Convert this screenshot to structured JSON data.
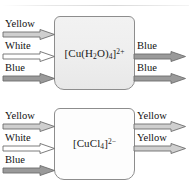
{
  "diagram": {
    "colors": {
      "yellow_beam": "#cfcfcf",
      "white_beam": "#ffffff",
      "blue_beam": "#9a9a9a",
      "outline": "#6e6e6e",
      "vessel_border": "#8d8d8d",
      "vessel_1_fill": "#eeeeee",
      "vessel_2_fill": "#fdfdfd",
      "text": "#111111"
    },
    "vessels": [
      {
        "id": "vessel-aqua-copper",
        "formula_text": "[Cu(H2O)4]2+",
        "formula_parts": {
          "open": "[Cu(H",
          "sub_1": "2",
          "mid": "O)",
          "sub_2": "4",
          "close": "]",
          "charge": "2+"
        },
        "inputs": [
          {
            "label": "Yellow",
            "beam": "yellow"
          },
          {
            "label": "White",
            "beam": "white"
          },
          {
            "label": "Blue",
            "beam": "blue"
          }
        ],
        "outputs": [
          {
            "label": "Blue",
            "beam": "blue"
          },
          {
            "label": "Blue",
            "beam": "blue"
          }
        ]
      },
      {
        "id": "vessel-chloro-copper",
        "formula_text": "[CuCl4]2-",
        "formula_parts": {
          "open": "[CuCl",
          "sub_1": "4",
          "mid": "",
          "sub_2": "",
          "close": "]",
          "charge": "2−"
        },
        "inputs": [
          {
            "label": "Yellow",
            "beam": "yellow"
          },
          {
            "label": "White",
            "beam": "white"
          },
          {
            "label": "Blue",
            "beam": "blue"
          }
        ],
        "outputs": [
          {
            "label": "Yellow",
            "beam": "yellow"
          },
          {
            "label": "Yellow",
            "beam": "yellow"
          }
        ]
      }
    ]
  }
}
